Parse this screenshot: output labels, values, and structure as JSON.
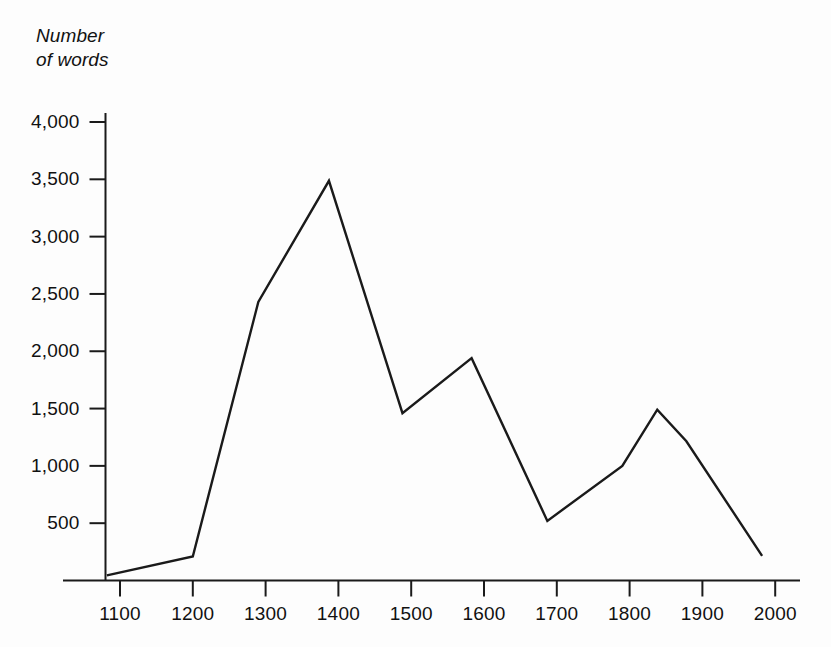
{
  "chart_data": {
    "type": "line",
    "title": "",
    "ylabel": "Number\nof words",
    "xlabel": "",
    "xlim": [
      1050,
      2050
    ],
    "ylim": [
      0,
      4000
    ],
    "grid": false,
    "legend": false,
    "x_ticks": [
      "1100",
      "1200",
      "1300",
      "1400",
      "1500",
      "1600",
      "1700",
      "1800",
      "1900",
      "2000"
    ],
    "y_ticks": [
      "4,000",
      "3,500",
      "3,000",
      "2,500",
      "2,000",
      "1,500",
      "1,000",
      "500"
    ],
    "x_tick_values": [
      1100,
      1200,
      1300,
      1400,
      1500,
      1600,
      1700,
      1800,
      1900,
      2000
    ],
    "y_tick_values": [
      4000,
      3500,
      3000,
      2500,
      2000,
      1500,
      1000,
      500
    ],
    "series": [
      {
        "name": "Number of words",
        "color": "#1a1a1a",
        "x": [
          1082,
          1200,
          1290,
          1387,
          1488,
          1583,
          1687,
          1790,
          1838,
          1878,
          1982
        ],
        "values": [
          45,
          210,
          2430,
          3487,
          1460,
          1940,
          520,
          1000,
          1490,
          1215,
          215
        ]
      }
    ]
  },
  "style": {
    "background": "#fdfdfd",
    "axis_color": "#1a1a1a",
    "text_color": "#111111",
    "line_color": "#1a1a1a"
  }
}
